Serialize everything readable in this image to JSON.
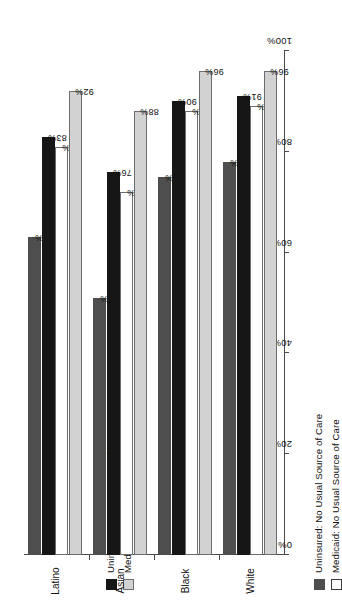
{
  "chart_data": {
    "type": "bar",
    "orientation": "horizontal",
    "title": "",
    "xlabel": "",
    "ylabel": "",
    "categories": [
      "Latino",
      "Asian",
      "Black",
      "White"
    ],
    "series": [
      {
        "name": "Uninsured: Usual Source of Care",
        "key": "black",
        "color": "#161616",
        "values": [
          83,
          76,
          90,
          91
        ]
      },
      {
        "name": "Medicaid: Usual Source of Care",
        "key": "lgray",
        "color": "#d2d2d2",
        "values": [
          92,
          88,
          96,
          96
        ]
      },
      {
        "name": "Uninsured: No Usual Source of Care",
        "key": "dgray",
        "color": "#4e4e4e",
        "values": [
          63,
          51,
          75,
          78
        ]
      },
      {
        "name": "Medicaid: No Usual Source of Care",
        "key": "white",
        "color": "#ffffff",
        "values": [
          81,
          72,
          88,
          89
        ]
      }
    ],
    "value_axis": {
      "ticks": [
        100,
        80,
        60,
        40,
        20,
        0
      ],
      "tick_labels": [
        "100%",
        "80%",
        "60%",
        "40%",
        "20%",
        "0%"
      ],
      "min": 0,
      "max": 100,
      "unit": "%",
      "reversed": true
    },
    "data_labels": {
      "Latino": {
        "lgray": "92%",
        "white": "81%",
        "black": "83%",
        "dgray": "63%"
      },
      "Asian": {
        "lgray": "88%",
        "white": "72%",
        "black": "76%",
        "dgray": "51%"
      },
      "Black": {
        "lgray": "96%",
        "white": "88%",
        "black": "90%",
        "dgray": "75%"
      },
      "White": {
        "lgray": "96%",
        "white": "89%",
        "black": "91%",
        "dgray": "78%"
      }
    },
    "grid": false,
    "legend_position": "left"
  },
  "legends": {
    "group_usual": [
      {
        "label": "Uninsured: Usual Source of Care",
        "swatch": "black"
      },
      {
        "label": "Medicaid: Usual Source of Care",
        "swatch": "lgray"
      }
    ],
    "group_no_usual": [
      {
        "label": "Uninsured: No Usual Source of Care",
        "swatch": "dgray"
      },
      {
        "label": "Medicaid: No Usual Source of Care",
        "swatch": "white"
      }
    ]
  },
  "axis": {
    "tick_labels": [
      "100%",
      "80%",
      "60%",
      "40%",
      "20%",
      "0%"
    ]
  },
  "categories": {
    "items": [
      {
        "label": "Latino"
      },
      {
        "label": "Asian"
      },
      {
        "label": "Black"
      },
      {
        "label": "White"
      }
    ]
  }
}
